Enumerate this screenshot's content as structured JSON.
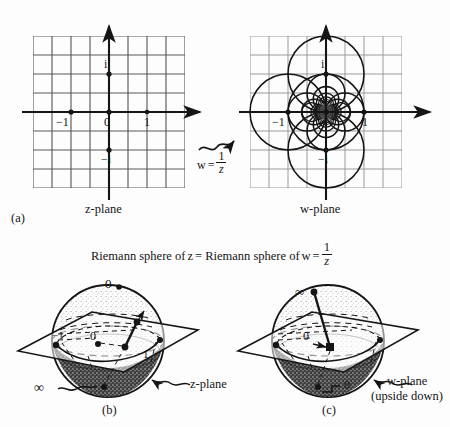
{
  "figure": {
    "panel_a": {
      "tag": "(a)",
      "map_label": {
        "lhs": "w",
        "equals": "=",
        "numerator": "1",
        "denominator": "z"
      },
      "left_plane": {
        "caption_italic": "z",
        "caption_rest": "-plane",
        "axis_marks": [
          "i",
          "0",
          "1",
          "−i",
          "−1"
        ],
        "marked_points": [
          {
            "label": "−1",
            "x": -1,
            "y": 0
          },
          {
            "label": "0",
            "x": 0,
            "y": 0
          },
          {
            "label": "1",
            "x": 1,
            "y": 0
          },
          {
            "label": "i",
            "x": 0,
            "y": 1
          },
          {
            "label": "−i",
            "x": 0,
            "y": -1
          }
        ],
        "grid": {
          "cols": 8,
          "rows": 8,
          "spacing_units": 0.5
        }
      },
      "right_plane": {
        "caption_italic": "w",
        "caption_rest": "-plane",
        "axis_marks": [
          "i",
          "−1",
          "1",
          "−i"
        ],
        "marked_points": [
          {
            "label": "−1",
            "x": -1,
            "y": 0
          },
          {
            "label": "",
            "x": 0,
            "y": 0
          },
          {
            "label": "1",
            "x": 1,
            "y": 0
          },
          {
            "label": "i",
            "x": 0,
            "y": 1
          },
          {
            "label": "−i",
            "x": 0,
            "y": -1
          }
        ],
        "grid": {
          "cols": 8,
          "rows": 8,
          "spacing_units": 0.5
        },
        "image_family": "circles tangent at origin (images of grid lines under w = 1/z)"
      }
    },
    "caption_mid": {
      "part1": "Riemann sphere of ",
      "z": "z",
      "part2": " = Riemann sphere of ",
      "w": "w",
      "equals": " = ",
      "numerator": "1",
      "denominator": "z"
    },
    "panel_b": {
      "tag": "(b)",
      "top_pole": "0",
      "plane_origin": "0",
      "bottom_pole": "∞",
      "plane_left_mark": "−1",
      "plane_right_mark": "1",
      "plane_caption_italic": "z",
      "plane_caption_rest": "-plane"
    },
    "panel_c": {
      "tag": "(c)",
      "top_pole": "∞",
      "plane_origin": "0",
      "bottom_pole": "0",
      "plane_caption_italic": "w",
      "plane_caption_rest": "-plane",
      "plane_caption_note": "(upside down)"
    },
    "colors": {
      "ink": "#151515",
      "grid_dark": "#4f4f4f",
      "grid_light": "#8d8d8d",
      "background": "#fdfdfd",
      "sphere_shade": "#9a9a9a"
    }
  }
}
